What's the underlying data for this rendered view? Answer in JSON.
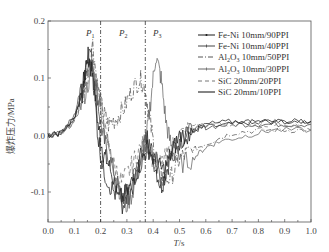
{
  "chart_data": {
    "type": "line",
    "title": "",
    "xlabel": "T/s",
    "ylabel": "爆炸压力/MPa",
    "xlim": [
      0.0,
      1.0
    ],
    "ylim": [
      -0.15,
      0.2
    ],
    "x_ticks": [
      "0.0",
      "0.1",
      "0.2",
      "0.3",
      "0.4",
      "0.5",
      "0.6",
      "0.7",
      "0.8",
      "0.9",
      "1.0"
    ],
    "y_ticks": [
      "0.2",
      "0.1",
      "0.0",
      "-0.1"
    ],
    "grid": false,
    "legend_position": "upper right",
    "annotations": [
      {
        "label": "P1",
        "x": 0.17
      },
      {
        "label": "P2",
        "x": 0.285
      },
      {
        "label": "P3",
        "x": 0.4
      }
    ],
    "vlines": [
      0.2,
      0.37
    ],
    "series": [
      {
        "name": "Fe-Ni 10mm/90PPI",
        "style": "solid-dot",
        "color": "#1a1a1a",
        "points": [
          [
            0,
            0.0
          ],
          [
            0.05,
            0.005
          ],
          [
            0.1,
            0.03
          ],
          [
            0.13,
            0.08
          ],
          [
            0.15,
            0.14
          ],
          [
            0.17,
            0.12
          ],
          [
            0.19,
            0.02
          ],
          [
            0.21,
            -0.03
          ],
          [
            0.23,
            -0.05
          ],
          [
            0.26,
            -0.09
          ],
          [
            0.28,
            -0.12
          ],
          [
            0.3,
            -0.11
          ],
          [
            0.33,
            -0.08
          ],
          [
            0.36,
            -0.02
          ],
          [
            0.38,
            0.0
          ],
          [
            0.4,
            -0.04
          ],
          [
            0.43,
            -0.09
          ],
          [
            0.45,
            -0.06
          ],
          [
            0.48,
            -0.02
          ],
          [
            0.52,
            0.0
          ],
          [
            0.56,
            0.01
          ],
          [
            0.6,
            0.015
          ],
          [
            0.7,
            0.02
          ],
          [
            0.8,
            0.025
          ],
          [
            0.9,
            0.025
          ],
          [
            1.0,
            0.025
          ]
        ]
      },
      {
        "name": "Fe-Ni 10mm/40PPI",
        "style": "solid-plus",
        "color": "#444444",
        "points": [
          [
            0,
            0.0
          ],
          [
            0.05,
            0.005
          ],
          [
            0.1,
            0.035
          ],
          [
            0.13,
            0.09
          ],
          [
            0.16,
            0.15
          ],
          [
            0.18,
            0.1
          ],
          [
            0.2,
            0.02
          ],
          [
            0.22,
            -0.02
          ],
          [
            0.25,
            -0.06
          ],
          [
            0.28,
            -0.11
          ],
          [
            0.31,
            -0.09
          ],
          [
            0.34,
            -0.05
          ],
          [
            0.37,
            -0.01
          ],
          [
            0.4,
            -0.03
          ],
          [
            0.43,
            -0.07
          ],
          [
            0.46,
            -0.04
          ],
          [
            0.5,
            -0.01
          ],
          [
            0.55,
            0.01
          ],
          [
            0.6,
            0.015
          ],
          [
            0.7,
            0.02
          ],
          [
            0.8,
            0.02
          ],
          [
            0.9,
            0.02
          ],
          [
            1.0,
            0.02
          ]
        ]
      },
      {
        "name": "Al2O3 10mm/50PPI",
        "style": "dash-dot",
        "color": "#555555",
        "points": [
          [
            0,
            0.0
          ],
          [
            0.05,
            0.005
          ],
          [
            0.1,
            0.03
          ],
          [
            0.14,
            0.09
          ],
          [
            0.17,
            0.16
          ],
          [
            0.19,
            0.08
          ],
          [
            0.21,
            0.04
          ],
          [
            0.23,
            0.02
          ],
          [
            0.26,
            0.03
          ],
          [
            0.29,
            0.05
          ],
          [
            0.32,
            0.08
          ],
          [
            0.35,
            0.1
          ],
          [
            0.37,
            0.08
          ],
          [
            0.39,
            0.02
          ],
          [
            0.41,
            -0.04
          ],
          [
            0.44,
            -0.08
          ],
          [
            0.47,
            -0.07
          ],
          [
            0.5,
            -0.04
          ],
          [
            0.53,
            -0.03
          ],
          [
            0.57,
            -0.02
          ],
          [
            0.62,
            -0.01
          ],
          [
            0.7,
            0.005
          ],
          [
            0.8,
            0.01
          ],
          [
            0.9,
            0.01
          ],
          [
            1.0,
            0.01
          ]
        ]
      },
      {
        "name": "Al2O3 10mm/30PPI",
        "style": "solid-plus",
        "color": "#666666",
        "points": [
          [
            0,
            0.0
          ],
          [
            0.05,
            0.005
          ],
          [
            0.1,
            0.025
          ],
          [
            0.14,
            0.07
          ],
          [
            0.17,
            0.12
          ],
          [
            0.2,
            0.05
          ],
          [
            0.23,
            -0.02
          ],
          [
            0.26,
            -0.07
          ],
          [
            0.29,
            -0.13
          ],
          [
            0.32,
            -0.1
          ],
          [
            0.35,
            -0.05
          ],
          [
            0.37,
            -0.02
          ],
          [
            0.39,
            0.06
          ],
          [
            0.41,
            0.14
          ],
          [
            0.43,
            0.1
          ],
          [
            0.45,
            0.02
          ],
          [
            0.47,
            -0.02
          ],
          [
            0.5,
            -0.05
          ],
          [
            0.55,
            -0.04
          ],
          [
            0.6,
            -0.02
          ],
          [
            0.65,
            -0.01
          ],
          [
            0.75,
            0.0
          ],
          [
            0.85,
            0.01
          ],
          [
            1.0,
            0.01
          ]
        ]
      },
      {
        "name": "SiC 20mm/20PPI",
        "style": "dashed",
        "color": "#777777",
        "points": [
          [
            0,
            0.0
          ],
          [
            0.05,
            0.005
          ],
          [
            0.1,
            0.025
          ],
          [
            0.14,
            0.08
          ],
          [
            0.17,
            0.13
          ],
          [
            0.2,
            0.06
          ],
          [
            0.22,
            0.0
          ],
          [
            0.25,
            -0.05
          ],
          [
            0.28,
            -0.08
          ],
          [
            0.31,
            -0.06
          ],
          [
            0.34,
            -0.03
          ],
          [
            0.37,
            -0.01
          ],
          [
            0.4,
            -0.04
          ],
          [
            0.43,
            -0.05
          ],
          [
            0.46,
            -0.03
          ],
          [
            0.5,
            0.0
          ],
          [
            0.55,
            0.015
          ],
          [
            0.6,
            0.02
          ],
          [
            0.7,
            0.02
          ],
          [
            0.8,
            0.02
          ],
          [
            0.9,
            0.02
          ],
          [
            1.0,
            0.02
          ]
        ]
      },
      {
        "name": "SiC 20mm/10PPI",
        "style": "solid",
        "color": "#222222",
        "points": [
          [
            0,
            0.0
          ],
          [
            0.05,
            0.005
          ],
          [
            0.1,
            0.03
          ],
          [
            0.13,
            0.07
          ],
          [
            0.15,
            0.13
          ],
          [
            0.17,
            0.11
          ],
          [
            0.19,
            0.0
          ],
          [
            0.21,
            -0.06
          ],
          [
            0.24,
            -0.09
          ],
          [
            0.27,
            -0.11
          ],
          [
            0.3,
            -0.1
          ],
          [
            0.33,
            -0.07
          ],
          [
            0.36,
            -0.04
          ],
          [
            0.38,
            -0.02
          ],
          [
            0.41,
            -0.05
          ],
          [
            0.44,
            -0.06
          ],
          [
            0.47,
            -0.03
          ],
          [
            0.5,
            0.0
          ],
          [
            0.55,
            0.01
          ],
          [
            0.6,
            0.02
          ],
          [
            0.7,
            0.025
          ],
          [
            0.8,
            0.025
          ],
          [
            0.9,
            0.025
          ],
          [
            1.0,
            0.025
          ]
        ]
      }
    ]
  },
  "axes": {
    "x_title_italic": "T",
    "x_title_unit": "/s",
    "y_title": "爆炸压力/MPa"
  },
  "legend": {
    "items": [
      {
        "main": "Fe-Ni 10mm/90PPI"
      },
      {
        "main": "Fe-Ni 10mm/40PPI"
      },
      {
        "pre": "Al",
        "sub1": "2",
        "mid": "O",
        "sub2": "3",
        "post": " 10mm/50PPI"
      },
      {
        "pre": "Al",
        "sub1": "2",
        "mid": "O",
        "sub2": "3",
        "post": " 10mm/30PPI"
      },
      {
        "main": "SiC 20mm/20PPI"
      },
      {
        "main": "SiC 20mm/10PPI"
      }
    ]
  },
  "phases": [
    {
      "letter": "P",
      "sub": "1"
    },
    {
      "letter": "P",
      "sub": "2"
    },
    {
      "letter": "P",
      "sub": "3"
    }
  ]
}
